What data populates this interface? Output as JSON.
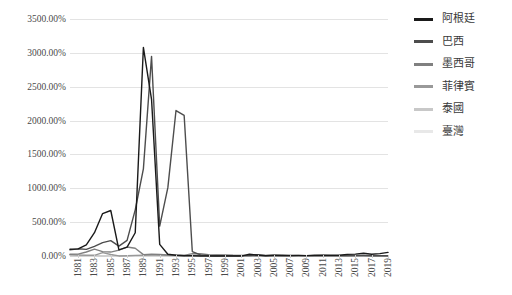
{
  "chart_data": {
    "type": "line",
    "title": "",
    "xlabel": "",
    "ylabel": "",
    "grid": true,
    "legend_position": "right",
    "ylim": [
      0,
      3500
    ],
    "y_ticks": [
      0,
      500,
      1000,
      1500,
      2000,
      2500,
      3000,
      3500
    ],
    "y_tick_labels": [
      "0.00%",
      "500.00%",
      "1000.00%",
      "1500.00%",
      "2000.00%",
      "2500.00%",
      "3000.00%",
      "3500.00%"
    ],
    "x": [
      1980,
      1981,
      1982,
      1983,
      1984,
      1985,
      1986,
      1987,
      1988,
      1989,
      1990,
      1991,
      1992,
      1993,
      1994,
      1995,
      1996,
      1997,
      1998,
      1999,
      2000,
      2001,
      2002,
      2003,
      2004,
      2005,
      2006,
      2007,
      2008,
      2009,
      2010,
      2011,
      2012,
      2013,
      2014,
      2015,
      2016,
      2017,
      2018,
      2019
    ],
    "x_tick_labels": [
      "1981",
      "1983",
      "1985",
      "1987",
      "1989",
      "1991",
      "1993",
      "1995",
      "1997",
      "1999",
      "2001",
      "2003",
      "2005",
      "2007",
      "2009",
      "2011",
      "2013",
      "2015",
      "2017",
      "2019"
    ],
    "series": [
      {
        "name": "阿根廷",
        "color": "#1a1a1a",
        "values": [
          100,
          105,
          165,
          344,
          627,
          672,
          90,
          131,
          343,
          3080,
          2314,
          172,
          25,
          11,
          4,
          3,
          0,
          0,
          1,
          -1,
          -1,
          -1,
          26,
          14,
          4,
          10,
          11,
          9,
          9,
          6,
          11,
          10,
          10,
          11,
          24,
          27,
          41,
          25,
          35,
          54
        ]
      },
      {
        "name": "巴西",
        "color": "#4d4d4d",
        "values": [
          90,
          106,
          98,
          142,
          197,
          227,
          145,
          230,
          682,
          1287,
          2948,
          441,
          1009,
          2148,
          2076,
          66,
          16,
          7,
          3,
          5,
          7,
          7,
          8,
          15,
          7,
          7,
          4,
          4,
          6,
          5,
          5,
          7,
          5,
          6,
          6,
          9,
          9,
          3,
          4,
          4
        ]
      },
      {
        "name": "墨西哥",
        "color": "#808080",
        "values": [
          26,
          28,
          59,
          101,
          65,
          58,
          86,
          132,
          114,
          20,
          27,
          23,
          15,
          10,
          7,
          35,
          34,
          21,
          16,
          17,
          9,
          6,
          5,
          4,
          5,
          4,
          4,
          4,
          5,
          5,
          4,
          3,
          4,
          4,
          4,
          3,
          3,
          6,
          5,
          4
        ]
      },
      {
        "name": "菲律賓",
        "color": "#999999",
        "values": [
          18,
          13,
          10,
          10,
          50,
          23,
          1,
          4,
          9,
          12,
          14,
          19,
          9,
          7,
          9,
          8,
          9,
          6,
          10,
          7,
          4,
          6,
          3,
          3,
          6,
          8,
          6,
          3,
          8,
          4,
          4,
          5,
          3,
          3,
          4,
          1,
          2,
          3,
          5,
          2
        ]
      },
      {
        "name": "泰國",
        "color": "#c8c8c8",
        "values": [
          20,
          13,
          5,
          4,
          1,
          2,
          2,
          2,
          4,
          5,
          6,
          6,
          4,
          3,
          5,
          6,
          6,
          6,
          8,
          0,
          2,
          2,
          1,
          2,
          3,
          5,
          5,
          2,
          5,
          -1,
          3,
          4,
          3,
          2,
          2,
          -1,
          0,
          1,
          1,
          1
        ]
      },
      {
        "name": "臺灣",
        "color": "#e8e8e8",
        "values": [
          19,
          16,
          3,
          1,
          0,
          0,
          1,
          1,
          1,
          4,
          4,
          4,
          4,
          3,
          4,
          4,
          3,
          1,
          2,
          0,
          1,
          0,
          0,
          0,
          2,
          2,
          1,
          2,
          4,
          -1,
          1,
          1,
          2,
          1,
          1,
          0,
          1,
          1,
          1,
          1
        ]
      }
    ]
  }
}
